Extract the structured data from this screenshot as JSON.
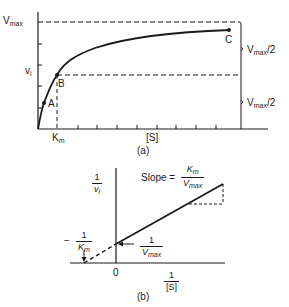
{
  "panel_a": {
    "caption": "(a)",
    "y_label_top": {
      "base": "V",
      "sub": "max"
    },
    "y_label_mid": {
      "base": "v",
      "sub": "i"
    },
    "x_label_km": {
      "base": "K",
      "sub": "m"
    },
    "x_axis_label": "[S]",
    "points": [
      {
        "name": "A",
        "label": "A"
      },
      {
        "name": "B",
        "label": "B"
      },
      {
        "name": "C",
        "label": "C"
      }
    ],
    "bracket_upper": {
      "base": "V",
      "sub": "max",
      "suffix": "/2"
    },
    "bracket_lower": {
      "base": "V",
      "sub": "max",
      "suffix": "/2"
    }
  },
  "panel_b": {
    "caption": "(b)",
    "y_axis_label": {
      "num": "1",
      "den": "v",
      "den_sub": "i"
    },
    "x_axis_label": {
      "num": "1",
      "den": "[S]"
    },
    "origin_label": "0",
    "x_intercept_label": {
      "sign": "−",
      "num": "1",
      "den": "K",
      "den_sub": "m"
    },
    "y_intercept_label": {
      "num": "1",
      "den": "V",
      "den_sub": "max"
    },
    "slope_label": {
      "prefix": "Slope =",
      "num": "K",
      "num_sub": "m",
      "den": "V",
      "den_sub": "max"
    }
  },
  "colors": {
    "ink": "#1a1a1a",
    "background": "#ffffff"
  }
}
